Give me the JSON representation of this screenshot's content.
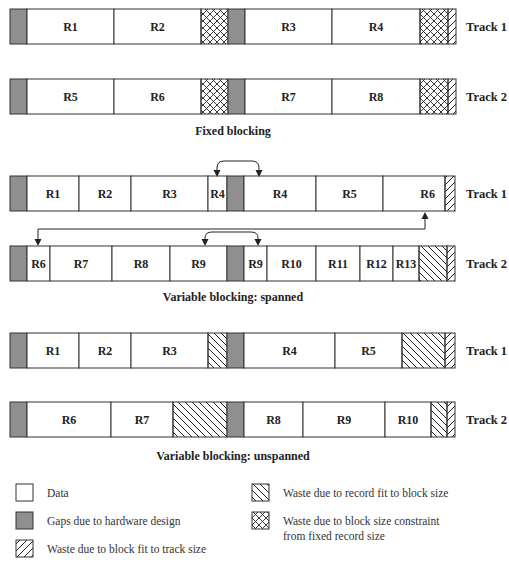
{
  "colors": {
    "gap": "#8f8f8f",
    "data": "#ffffff",
    "stroke": "#333333"
  },
  "sections": [
    {
      "id": "fixed",
      "caption": "Fixed blocking",
      "tracks": [
        {
          "label": "Track 1",
          "segments": [
            {
              "type": "gap"
            },
            {
              "type": "data",
              "label": "R1",
              "size": 87
            },
            {
              "type": "data",
              "label": "R2",
              "size": 87
            },
            {
              "type": "crosshatch",
              "size": 27
            },
            {
              "type": "gap"
            },
            {
              "type": "data",
              "label": "R3",
              "size": 87
            },
            {
              "type": "data",
              "label": "R4",
              "size": 88
            },
            {
              "type": "crosshatch",
              "size": 28
            },
            {
              "type": "forward",
              "size": 8
            }
          ]
        },
        {
          "label": "Track 2",
          "segments": [
            {
              "type": "gap"
            },
            {
              "type": "data",
              "label": "R5",
              "size": 87
            },
            {
              "type": "data",
              "label": "R6",
              "size": 87
            },
            {
              "type": "crosshatch",
              "size": 27
            },
            {
              "type": "gap"
            },
            {
              "type": "data",
              "label": "R7",
              "size": 87
            },
            {
              "type": "data",
              "label": "R8",
              "size": 88
            },
            {
              "type": "crosshatch",
              "size": 28
            },
            {
              "type": "forward",
              "size": 8
            }
          ]
        }
      ]
    },
    {
      "id": "spanned",
      "caption": "Variable blocking: spanned",
      "tracks": [
        {
          "label": "Track 1",
          "segments": [
            {
              "type": "gap"
            },
            {
              "type": "data",
              "label": "R1",
              "size": 52
            },
            {
              "type": "data",
              "label": "R2",
              "size": 52
            },
            {
              "type": "data",
              "label": "R3",
              "size": 77
            },
            {
              "type": "data",
              "label": "R4",
              "size": 19
            },
            {
              "type": "gap"
            },
            {
              "type": "data",
              "label": "R4",
              "size": 72
            },
            {
              "type": "data",
              "label": "R5",
              "size": 67
            },
            {
              "type": "data",
              "label": "R6",
              "size": 62,
              "align": "right"
            },
            {
              "type": "forward",
              "size": 10
            }
          ]
        },
        {
          "label": "Track 2",
          "segments": [
            {
              "type": "gap"
            },
            {
              "type": "data",
              "label": "R6",
              "size": 23
            },
            {
              "type": "data",
              "label": "R7",
              "size": 62
            },
            {
              "type": "data",
              "label": "R8",
              "size": 58
            },
            {
              "type": "data",
              "label": "R9",
              "size": 57
            },
            {
              "type": "gap"
            },
            {
              "type": "data",
              "label": "R9",
              "size": 23
            },
            {
              "type": "data",
              "label": "R10",
              "size": 49
            },
            {
              "type": "data",
              "label": "R11",
              "size": 44
            },
            {
              "type": "data",
              "label": "R12",
              "size": 33
            },
            {
              "type": "data",
              "label": "R13",
              "size": 26
            },
            {
              "type": "backward",
              "size": 28
            },
            {
              "type": "forward",
              "size": 8
            }
          ]
        }
      ],
      "arrows": [
        {
          "name": "r4-continuation-arrow",
          "from": "track1-R4-part1",
          "to": "track1-R4-part2"
        },
        {
          "name": "r6-continuation-arrow",
          "from": "track1-R6-part1",
          "to": "track2-R6-part2"
        },
        {
          "name": "r9-continuation-arrow",
          "from": "track2-R9-part1",
          "to": "track2-R9-part2"
        }
      ]
    },
    {
      "id": "unspanned",
      "caption": "Variable blocking: unspanned",
      "tracks": [
        {
          "label": "Track 1",
          "segments": [
            {
              "type": "gap"
            },
            {
              "type": "data",
              "label": "R1",
              "size": 52
            },
            {
              "type": "data",
              "label": "R2",
              "size": 52
            },
            {
              "type": "data",
              "label": "R3",
              "size": 77
            },
            {
              "type": "backward",
              "size": 19
            },
            {
              "type": "gap"
            },
            {
              "type": "data",
              "label": "R4",
              "size": 91
            },
            {
              "type": "data",
              "label": "R5",
              "size": 67
            },
            {
              "type": "backward",
              "size": 43
            },
            {
              "type": "forward",
              "size": 10
            }
          ]
        },
        {
          "label": "Track 2",
          "segments": [
            {
              "type": "gap"
            },
            {
              "type": "data",
              "label": "R6",
              "size": 84
            },
            {
              "type": "data",
              "label": "R7",
              "size": 62
            },
            {
              "type": "backward",
              "size": 54
            },
            {
              "type": "gap"
            },
            {
              "type": "data",
              "label": "R8",
              "size": 59
            },
            {
              "type": "data",
              "label": "R9",
              "size": 82
            },
            {
              "type": "data",
              "label": "R10",
              "size": 46
            },
            {
              "type": "backward",
              "size": 16
            },
            {
              "type": "forward",
              "size": 8
            }
          ]
        }
      ]
    }
  ],
  "legend": [
    {
      "type": "data",
      "label": "Data"
    },
    {
      "type": "gap",
      "label": "Gaps due to hardware design"
    },
    {
      "type": "forward",
      "label": "Waste due to block fit to track size"
    },
    {
      "type": "backward",
      "label": "Waste due to record fit to block size"
    },
    {
      "type": "crosshatch",
      "label": "Waste due to block size constraint",
      "label2": "from fixed record size"
    }
  ]
}
